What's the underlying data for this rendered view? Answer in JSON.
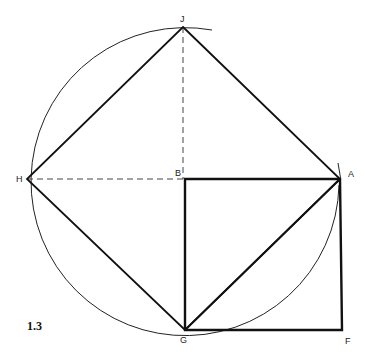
{
  "figure": {
    "number": "1.3",
    "points": {
      "J": {
        "label": "J",
        "x": 183,
        "y": 27
      },
      "H": {
        "label": "H",
        "x": 27,
        "y": 179
      },
      "B": {
        "label": "B",
        "x": 183,
        "y": 179
      },
      "A": {
        "label": "A",
        "x": 340,
        "y": 179
      },
      "G": {
        "label": "G",
        "x": 185,
        "y": 330
      },
      "F": {
        "label": "F",
        "x": 342,
        "y": 330
      }
    },
    "colors": {
      "line": "#111111",
      "background": "#ffffff"
    }
  }
}
